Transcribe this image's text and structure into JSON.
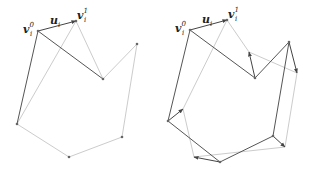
{
  "labels": {
    "v0": "v",
    "v0_sup": "0",
    "v0_sub": "i",
    "v1": "v",
    "v1_sup": "1",
    "v1_sub": "i",
    "u": "u",
    "u_sub": "i"
  },
  "colors": {
    "dark": "#555555",
    "light": "#cccccc",
    "vertex": "#666666"
  },
  "panels": [
    {
      "name": "left",
      "polygon": [
        [
          38,
          31
        ],
        [
          76,
          21
        ],
        [
          103,
          79
        ],
        [
          137,
          44
        ],
        [
          122,
          137
        ],
        [
          69,
          157
        ],
        [
          17,
          124
        ]
      ],
      "light_edges": [
        [
          [
            76,
            21
          ],
          [
            103,
            79
          ]
        ],
        [
          [
            103,
            79
          ],
          [
            137,
            44
          ]
        ],
        [
          [
            137,
            44
          ],
          [
            122,
            137
          ]
        ],
        [
          [
            122,
            137
          ],
          [
            69,
            157
          ]
        ],
        [
          [
            69,
            157
          ],
          [
            17,
            124
          ]
        ],
        [
          [
            17,
            124
          ],
          [
            76,
            21
          ]
        ]
      ],
      "dark_edges": [
        [
          [
            38,
            31
          ],
          [
            103,
            79
          ]
        ],
        [
          [
            38,
            31
          ],
          [
            17,
            124
          ]
        ]
      ],
      "arrows": [
        [
          [
            38,
            31
          ],
          [
            76,
            21
          ]
        ]
      ],
      "label_pos": {
        "v0": [
          23,
          33
        ],
        "v1": [
          77,
          19
        ],
        "u": [
          50,
          24
        ]
      }
    },
    {
      "name": "right",
      "polygon": [
        [
          190,
          30
        ],
        [
          227,
          20
        ],
        [
          255,
          78
        ],
        [
          289,
          42
        ],
        [
          273,
          136
        ],
        [
          220,
          162
        ],
        [
          168,
          121
        ]
      ],
      "light_edges": [
        [
          [
            227,
            20
          ],
          [
            249,
            52
          ]
        ],
        [
          [
            249,
            52
          ],
          [
            297,
            73
          ]
        ],
        [
          [
            297,
            73
          ],
          [
            285,
            147
          ]
        ],
        [
          [
            285,
            147
          ],
          [
            194,
            157
          ]
        ],
        [
          [
            194,
            157
          ],
          [
            183,
            109
          ]
        ],
        [
          [
            183,
            109
          ],
          [
            227,
            20
          ]
        ]
      ],
      "dark_edges": [
        [
          [
            190,
            30
          ],
          [
            255,
            78
          ]
        ],
        [
          [
            190,
            30
          ],
          [
            168,
            121
          ]
        ],
        [
          [
            255,
            78
          ],
          [
            289,
            42
          ]
        ],
        [
          [
            289,
            42
          ],
          [
            273,
            136
          ]
        ],
        [
          [
            273,
            136
          ],
          [
            220,
            162
          ]
        ],
        [
          [
            220,
            162
          ],
          [
            168,
            121
          ]
        ]
      ],
      "arrows": [
        [
          [
            190,
            30
          ],
          [
            227,
            20
          ]
        ],
        [
          [
            255,
            78
          ],
          [
            249,
            52
          ]
        ],
        [
          [
            289,
            42
          ],
          [
            297,
            73
          ]
        ],
        [
          [
            273,
            136
          ],
          [
            285,
            147
          ]
        ],
        [
          [
            220,
            162
          ],
          [
            194,
            157
          ]
        ],
        [
          [
            168,
            121
          ],
          [
            183,
            109
          ]
        ]
      ],
      "label_pos": {
        "v0": [
          175,
          32
        ],
        "v1": [
          228,
          18
        ],
        "u": [
          202,
          23
        ]
      }
    }
  ]
}
